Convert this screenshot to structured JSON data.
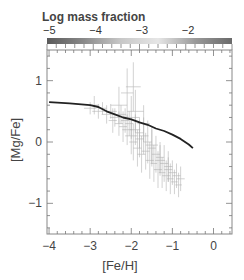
{
  "chart_data": {
    "type": "scatter",
    "title": "",
    "colorbar": {
      "label": "Log mass fraction",
      "ticks": [
        -5,
        -4,
        -3,
        -2
      ],
      "tick_labels": [
        "−5",
        "−4",
        "−3",
        "−2"
      ],
      "range": [
        -5,
        -1
      ],
      "gradient": [
        "#5a5a5a",
        "#8a8a8a",
        "#c8c8c8",
        "#e6e6e6",
        "#9a9a9a",
        "#6a6a6a"
      ]
    },
    "xlabel": "[Fe/H]",
    "ylabel": "[Mg/Fe]",
    "xlim": [
      -4.05,
      0.45
    ],
    "ylim": [
      -1.5,
      1.5
    ],
    "xticks": [
      -4,
      -3,
      -2,
      -1,
      0
    ],
    "xtick_labels": [
      "−4",
      "−3",
      "−2",
      "−1",
      "0"
    ],
    "yticks": [
      -1,
      0,
      1
    ],
    "ytick_labels": [
      "−1",
      "0",
      "1"
    ],
    "grid": false,
    "legend": null,
    "series": [
      {
        "name": "model track",
        "style": "line",
        "color": "#222222",
        "x": [
          -4.0,
          -3.5,
          -3.0,
          -2.8,
          -2.6,
          -2.4,
          -2.2,
          -2.0,
          -1.8,
          -1.6,
          -1.4,
          -1.2,
          -1.0,
          -0.8,
          -0.6,
          -0.5
        ],
        "y": [
          0.65,
          0.63,
          0.6,
          0.57,
          0.5,
          0.45,
          0.4,
          0.37,
          0.32,
          0.28,
          0.22,
          0.18,
          0.12,
          0.05,
          -0.04,
          -0.1
        ]
      },
      {
        "name": "observations (with error bars)",
        "style": "scatter-errorbars",
        "color": "#aaaaaa",
        "x": [
          -3.0,
          -2.9,
          -2.8,
          -2.7,
          -2.6,
          -2.5,
          -2.45,
          -2.4,
          -2.3,
          -2.25,
          -2.2,
          -2.15,
          -2.1,
          -2.05,
          -2.0,
          -2.0,
          -1.95,
          -1.9,
          -1.85,
          -1.8,
          -1.8,
          -1.75,
          -1.7,
          -1.65,
          -1.6,
          -1.55,
          -1.5,
          -1.45,
          -1.4,
          -1.35,
          -1.3,
          -1.25,
          -1.2,
          -1.15,
          -1.1,
          -1.05,
          -1.0,
          -0.95,
          -0.9,
          -0.85,
          -0.8,
          -1.9,
          -1.7,
          -1.5,
          -1.3,
          -1.1,
          -2.3,
          -2.1,
          -1.95
        ],
        "y": [
          0.55,
          0.6,
          0.5,
          0.55,
          0.45,
          0.5,
          0.35,
          0.4,
          0.3,
          0.45,
          0.25,
          0.35,
          0.2,
          0.3,
          0.1,
          0.4,
          0.0,
          0.2,
          -0.1,
          0.15,
          0.05,
          -0.2,
          0.1,
          -0.15,
          0.0,
          -0.3,
          -0.1,
          -0.35,
          -0.2,
          -0.45,
          -0.25,
          -0.5,
          -0.35,
          -0.55,
          -0.4,
          -0.6,
          -0.5,
          -0.65,
          -0.55,
          -0.7,
          -0.6,
          0.5,
          0.3,
          -0.05,
          -0.3,
          -0.45,
          0.6,
          0.8,
          0.9
        ],
        "xerr": [
          0.15,
          0.12,
          0.15,
          0.1,
          0.12,
          0.15,
          0.1,
          0.12,
          0.1,
          0.12,
          0.1,
          0.1,
          0.12,
          0.1,
          0.15,
          0.2,
          0.1,
          0.12,
          0.1,
          0.1,
          0.1,
          0.1,
          0.12,
          0.1,
          0.1,
          0.1,
          0.1,
          0.08,
          0.1,
          0.1,
          0.1,
          0.08,
          0.1,
          0.1,
          0.1,
          0.08,
          0.1,
          0.08,
          0.1,
          0.08,
          0.1,
          0.2,
          0.15,
          0.15,
          0.12,
          0.1,
          0.2,
          0.15,
          0.18
        ],
        "yerr": [
          0.1,
          0.15,
          0.12,
          0.1,
          0.15,
          0.12,
          0.2,
          0.15,
          0.2,
          0.15,
          0.25,
          0.2,
          0.25,
          0.2,
          0.3,
          0.35,
          0.3,
          0.25,
          0.3,
          0.25,
          0.3,
          0.3,
          0.3,
          0.3,
          0.35,
          0.3,
          0.3,
          0.3,
          0.3,
          0.3,
          0.25,
          0.25,
          0.3,
          0.25,
          0.25,
          0.25,
          0.2,
          0.2,
          0.2,
          0.2,
          0.2,
          0.35,
          0.3,
          0.3,
          0.25,
          0.2,
          0.3,
          0.4,
          0.4
        ]
      }
    ]
  }
}
